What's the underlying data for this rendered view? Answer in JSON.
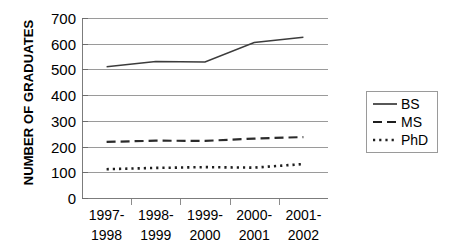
{
  "chart_data": {
    "type": "line",
    "title": "",
    "xlabel": "",
    "ylabel": "NUMBER OF GRADUATES",
    "categories": [
      "1997-1998",
      "1998-1999",
      "1999-2000",
      "2000-2001",
      "2001-2002"
    ],
    "category_lines": [
      [
        "1997-",
        "1998"
      ],
      [
        "1998-",
        "1999"
      ],
      [
        "1999-",
        "2000"
      ],
      [
        "2000-",
        "2001"
      ],
      [
        "2001-",
        "2002"
      ]
    ],
    "ylim": [
      0,
      700
    ],
    "ytick_step": 100,
    "yticks": [
      700,
      600,
      500,
      400,
      300,
      200,
      100,
      0
    ],
    "ytick_labels": [
      "700",
      "600",
      "500",
      "400",
      "300",
      "200",
      "100",
      "0"
    ],
    "grid": true,
    "grid_orientation": "horizontal",
    "legend_position": "right",
    "series": [
      {
        "name": "BS",
        "style": "solid",
        "color": "#3c3c3c",
        "values": [
          510,
          531,
          529,
          605,
          625
        ]
      },
      {
        "name": "MS",
        "style": "dashed",
        "color": "#2b2b2b",
        "values": [
          218,
          223,
          222,
          231,
          237
        ]
      },
      {
        "name": "PhD",
        "style": "dotted",
        "color": "#1f1f1f",
        "values": [
          112,
          117,
          120,
          118,
          132
        ]
      }
    ]
  },
  "legend": {
    "items": [
      {
        "label": "BS",
        "style": "solid"
      },
      {
        "label": "MS",
        "style": "dashed"
      },
      {
        "label": "PhD",
        "style": "dotted"
      }
    ]
  }
}
